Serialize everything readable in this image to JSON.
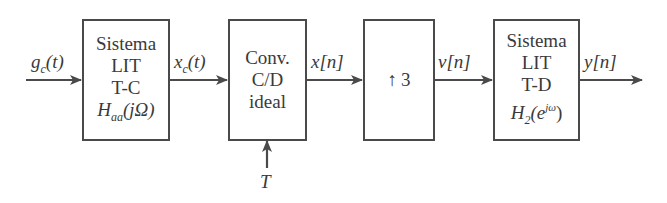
{
  "diagram": {
    "type": "signal-processing-block-diagram",
    "colors": {
      "stroke": "#4a4a4a",
      "text": "#3a3a3a",
      "background": "#ffffff"
    },
    "signals": {
      "input": {
        "base": "g",
        "sub": "c",
        "arg": "(t)"
      },
      "after_aa": {
        "base": "x",
        "sub": "c",
        "arg": "(t)"
      },
      "after_cd": {
        "base": "x",
        "arg": "[n]"
      },
      "after_up": {
        "base": "v",
        "arg": "[n]"
      },
      "output": {
        "base": "y",
        "arg": "[n]"
      },
      "sampling_period": "T"
    },
    "blocks": [
      {
        "id": "aa-filter",
        "lines": [
          "Sistema",
          "LIT",
          "T-C"
        ],
        "tf": {
          "base": "H",
          "sub": "aa",
          "arg": "(jΩ)"
        }
      },
      {
        "id": "cd-converter",
        "lines": [
          "Conv.",
          "C/D",
          "ideal"
        ]
      },
      {
        "id": "upsampler",
        "symbol": "↑",
        "factor": "3"
      },
      {
        "id": "dt-filter",
        "lines": [
          "Sistema",
          "LIT",
          "T-D"
        ],
        "tf": {
          "base": "H",
          "sub": "2",
          "open": "(e",
          "sup": "jω",
          "close": ")"
        }
      }
    ]
  }
}
